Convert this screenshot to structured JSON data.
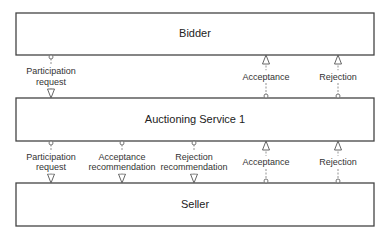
{
  "diagram": {
    "boxes": [
      {
        "id": "bidder",
        "label": "Bidder"
      },
      {
        "id": "auctioning",
        "label": "Auctioning Service 1"
      },
      {
        "id": "seller",
        "label": "Seller"
      }
    ],
    "connectors_top": [
      {
        "lines": [
          "Participation",
          "request"
        ],
        "from": "bidder",
        "to": "auctioning"
      },
      {
        "lines": [
          "Acceptance"
        ],
        "from": "auctioning",
        "to": "bidder"
      },
      {
        "lines": [
          "Rejection"
        ],
        "from": "auctioning",
        "to": "bidder"
      }
    ],
    "connectors_bottom": [
      {
        "lines": [
          "Participation",
          "request"
        ],
        "from": "auctioning",
        "to": "seller"
      },
      {
        "lines": [
          "Acceptance",
          "recommendation"
        ],
        "from": "auctioning",
        "to": "seller"
      },
      {
        "lines": [
          "Rejection",
          "recommendation"
        ],
        "from": "auctioning",
        "to": "seller"
      },
      {
        "lines": [
          "Acceptance"
        ],
        "from": "seller",
        "to": "auctioning"
      },
      {
        "lines": [
          "Rejection"
        ],
        "from": "seller",
        "to": "auctioning"
      }
    ]
  }
}
